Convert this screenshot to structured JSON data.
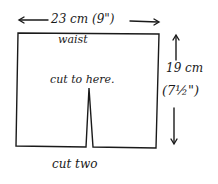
{
  "diagram": {
    "width_label": "23 cm (9\")",
    "waist_label": "waist",
    "cut_label": "cut to here.",
    "height_label_cm": "19 cm",
    "height_label_in": "(7½\")",
    "instruction": "cut two"
  }
}
